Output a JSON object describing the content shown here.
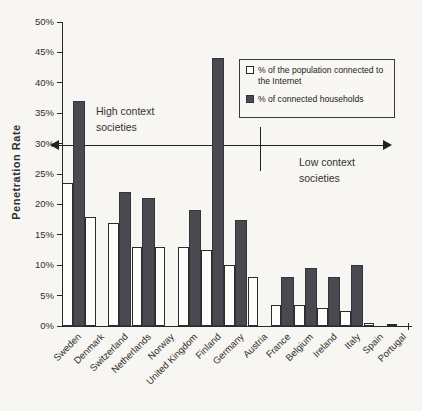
{
  "chart_data": {
    "type": "bar",
    "title": "",
    "xlabel": "",
    "ylabel": "Penetration Rate",
    "ylim": [
      0,
      50
    ],
    "ytick_step": 5,
    "ytick_labels": [
      "0%",
      "5%",
      "10%",
      "15%",
      "20%",
      "25%",
      "30%",
      "35%",
      "40%",
      "45%",
      "50%"
    ],
    "grid": false,
    "legend_position": "top-right",
    "categories": [
      "Sweden",
      "Denmark",
      "Switzerland",
      "Netherlands",
      "Norway",
      "United Kingdom",
      "Finland",
      "Germany",
      "Austria",
      "France",
      "Belgium",
      "Ireland",
      "Italy",
      "Spain",
      "Portugal"
    ],
    "series": [
      {
        "name": "% of the population connected to the Internet",
        "style": "white",
        "color": "#fdfdfb",
        "values": [
          23.5,
          18,
          17,
          13,
          13,
          13,
          12.5,
          10,
          8,
          3.5,
          3.5,
          3,
          2.5,
          0.5,
          0.4
        ]
      },
      {
        "name": "% of connected households",
        "style": "dark",
        "color": "#49494f",
        "values": [
          37,
          null,
          22,
          21,
          null,
          19,
          44,
          17.5,
          null,
          8,
          9.5,
          8,
          10,
          null,
          null
        ]
      }
    ],
    "annotations": {
      "high_context": {
        "line1": "High context",
        "line2": "societies"
      },
      "low_context": {
        "line1": "Low context",
        "line2": "societies"
      },
      "divider_note": "double-headed arrow at ~30% separating high and low context societies"
    }
  },
  "colors": {
    "background": "#f7f6f2",
    "bar_dark": "#49494f",
    "bar_white": "#fdfdfb",
    "axis": "#2a2a2a"
  }
}
